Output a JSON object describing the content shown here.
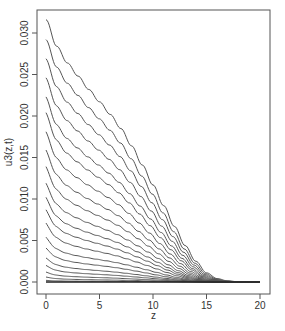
{
  "chart_data": {
    "type": "line",
    "title": "",
    "xlabel": "z",
    "ylabel": "u3(z,t)",
    "xlim": [
      0,
      20
    ],
    "ylim": [
      0,
      0.0316
    ],
    "xticks": [
      0,
      5,
      10,
      15,
      20
    ],
    "xtick_labels": [
      "0",
      "5",
      "10",
      "15",
      "20"
    ],
    "yticks": [
      0.0,
      0.005,
      0.01,
      0.015,
      0.02,
      0.025,
      0.03
    ],
    "ytick_labels": [
      "0.000",
      "0.005",
      "0.010",
      "0.015",
      "0.020",
      "0.025",
      "0.030"
    ],
    "grid": false,
    "legend": "none",
    "line_color": "#555555",
    "z": [
      0,
      1,
      2,
      3,
      4,
      5,
      6,
      7,
      8,
      9,
      10,
      11,
      12,
      13,
      14,
      15,
      16,
      17,
      18,
      19,
      20
    ],
    "shape": [
      1.0,
      0.899,
      0.835,
      0.785,
      0.734,
      0.687,
      0.639,
      0.585,
      0.519,
      0.446,
      0.37,
      0.291,
      0.212,
      0.139,
      0.079,
      0.035,
      0.013,
      0.004,
      0.001,
      0.0,
      0.0
    ],
    "series": [
      {
        "name": "t1",
        "start": 0.0316,
        "drop": 0.0
      },
      {
        "name": "t2",
        "start": 0.0292,
        "drop": 0.02
      },
      {
        "name": "t3",
        "start": 0.0269,
        "drop": 0.04
      },
      {
        "name": "t4",
        "start": 0.0246,
        "drop": 0.06
      },
      {
        "name": "t5",
        "start": 0.0223,
        "drop": 0.08
      },
      {
        "name": "t6",
        "start": 0.0204,
        "drop": 0.1
      },
      {
        "name": "t7",
        "start": 0.0181,
        "drop": 0.12
      },
      {
        "name": "t8",
        "start": 0.0159,
        "drop": 0.14
      },
      {
        "name": "t9",
        "start": 0.0139,
        "drop": 0.16
      },
      {
        "name": "t10",
        "start": 0.0119,
        "drop": 0.18
      },
      {
        "name": "t11",
        "start": 0.0102,
        "drop": 0.2
      },
      {
        "name": "t12",
        "start": 0.0087,
        "drop": 0.22
      },
      {
        "name": "t13",
        "start": 0.0071,
        "drop": 0.24
      },
      {
        "name": "t14",
        "start": 0.0054,
        "drop": 0.26
      },
      {
        "name": "t15",
        "start": 0.0041,
        "drop": 0.28
      },
      {
        "name": "t16",
        "start": 0.0029,
        "drop": 0.3
      },
      {
        "name": "t17",
        "start": 0.002,
        "drop": 0.32
      },
      {
        "name": "t18",
        "start": 0.0012,
        "drop": 0.34
      },
      {
        "name": "t19",
        "start": 0.0006,
        "drop": 0.36
      },
      {
        "name": "t20",
        "start": 0.0002,
        "drop": 0.38
      },
      {
        "name": "t21",
        "start": 0.0,
        "drop": 0.4
      }
    ]
  },
  "layout": {
    "box": {
      "left": 37,
      "top": 10,
      "right": 270,
      "bottom": 294
    },
    "x_px": {
      "v0": 46,
      "v1": 260
    },
    "y_px": {
      "v0": 282,
      "v_0030": 33
    }
  }
}
